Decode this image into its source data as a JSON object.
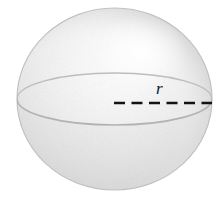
{
  "figure": {
    "kind": "geometry-solid-diagram",
    "shape_name": "sphere",
    "background_color": "#ffffff",
    "labels": {
      "radius": "r"
    },
    "sphere": {
      "center_x": 114.5,
      "center_y": 99,
      "radius_x": 97.5,
      "radius_y": 91,
      "fill_light": "#fdfdfd",
      "fill_mid": "#e9e9e9",
      "fill_dark": "#cfcfcf",
      "outline_color": "#c2c2c2",
      "highlight_x": 140,
      "highlight_y": 52,
      "texture": "stipple-grain"
    },
    "equator": {
      "center_x": 114.5,
      "center_y": 99,
      "radius_x": 97.5,
      "radius_y": 26,
      "stroke_color": "#b4b4b4",
      "front_visible": true,
      "back_visible": true
    },
    "radius_line": {
      "x_start": 114,
      "x_end": 212,
      "y": 103,
      "stroke_color": "#131313",
      "stroke_width": 2.4,
      "dash_length": 11,
      "gap_length": 6.5,
      "style": "dashed"
    }
  }
}
